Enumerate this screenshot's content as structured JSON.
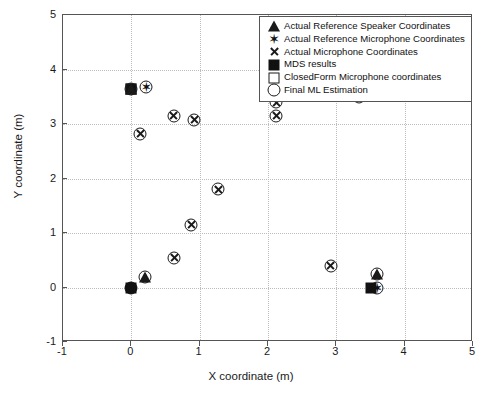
{
  "chart_data": {
    "type": "scatter",
    "title": "",
    "xlabel": "X coordinate (m)",
    "ylabel": "Y coordinate (m)",
    "xlim": [
      -1,
      5
    ],
    "ylim": [
      -1,
      5
    ],
    "xticks": [
      "-1",
      "0",
      "1",
      "2",
      "3",
      "4",
      "5"
    ],
    "yticks": [
      "-1",
      "0",
      "1",
      "2",
      "3",
      "4",
      "5"
    ],
    "xtick_values": [
      -1,
      0,
      1,
      2,
      3,
      4,
      5
    ],
    "ytick_values": [
      -1,
      0,
      1,
      2,
      3,
      4,
      5
    ],
    "grid": true,
    "legend_position": "top-right",
    "series": [
      {
        "name": "Actual Reference Speaker Coordinates",
        "marker": "triangle",
        "points": [
          [
            0.0,
            3.65
          ],
          [
            0.2,
            0.2
          ],
          [
            3.6,
            0.25
          ]
        ]
      },
      {
        "name": "Actual Reference Microphone Coordinates",
        "marker": "hexagram-star",
        "points": [
          [
            0.22,
            3.67
          ],
          [
            3.6,
            0.0
          ]
        ]
      },
      {
        "name": "Actual Microphone Coordinates",
        "marker": "x",
        "points": [
          [
            0.13,
            2.82
          ],
          [
            0.62,
            3.15
          ],
          [
            0.92,
            3.08
          ],
          [
            2.12,
            3.4
          ],
          [
            2.12,
            3.15
          ],
          [
            3.33,
            3.5
          ],
          [
            1.27,
            1.8
          ],
          [
            0.88,
            1.15
          ],
          [
            0.63,
            0.55
          ],
          [
            2.92,
            0.4
          ]
        ]
      },
      {
        "name": "MDS results",
        "marker": "filled-square",
        "points": [
          [
            0.0,
            3.65
          ],
          [
            0.0,
            0.0
          ],
          [
            3.5,
            0.0
          ]
        ]
      },
      {
        "name": "ClosedForm Microphone coordinates",
        "marker": "open-square",
        "points": [
          [
            0.0,
            3.65
          ]
        ]
      },
      {
        "name": "Final ML Estimation",
        "marker": "open-circle",
        "points": [
          [
            0.0,
            3.65
          ],
          [
            0.22,
            3.67
          ],
          [
            0.13,
            2.82
          ],
          [
            0.62,
            3.15
          ],
          [
            0.92,
            3.08
          ],
          [
            2.12,
            3.4
          ],
          [
            2.12,
            3.15
          ],
          [
            3.33,
            3.5
          ],
          [
            1.27,
            1.8
          ],
          [
            0.88,
            1.15
          ],
          [
            0.63,
            0.55
          ],
          [
            2.92,
            0.4
          ],
          [
            0.2,
            0.2
          ],
          [
            3.6,
            0.25
          ],
          [
            3.6,
            0.0
          ],
          [
            0.0,
            0.0
          ]
        ]
      }
    ]
  },
  "legend": {
    "entries": [
      {
        "label": "Actual Reference Speaker Coordinates",
        "glyph": "triangle-icon"
      },
      {
        "label": "Actual Reference Microphone Coordinates",
        "glyph": "star-icon"
      },
      {
        "label": "Actual Microphone Coordinates",
        "glyph": "x-icon"
      },
      {
        "label": "MDS results",
        "glyph": "filled-square-icon"
      },
      {
        "label": "ClosedForm Microphone coordinates",
        "glyph": "open-square-icon"
      },
      {
        "label": "Final ML Estimation",
        "glyph": "open-circle-icon"
      }
    ]
  },
  "colors": {
    "marker": "#1a1a1a",
    "axis": "#555555",
    "grid": "#bdbdbd",
    "background": "#ffffff"
  }
}
